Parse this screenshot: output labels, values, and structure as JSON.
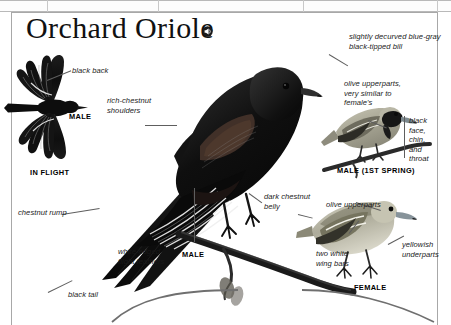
{
  "page": {
    "title": "Orchard Oriole",
    "audio_icon": "speaker-icon"
  },
  "callouts": [
    {
      "id": "black-back",
      "text": "black back"
    },
    {
      "id": "rich-chestnut",
      "text": "rich-chestnut\nshoulders"
    },
    {
      "id": "chestnut-rump",
      "text": "chestnut rump"
    },
    {
      "id": "white-edged",
      "text": "white-edged\nflight feathers"
    },
    {
      "id": "black-tail",
      "text": "black tail"
    },
    {
      "id": "dark-chestnut",
      "text": "dark chestnut\nbelly"
    },
    {
      "id": "decurved-bill",
      "text": "slightly decurved blue-gray\nblack-tipped bill"
    },
    {
      "id": "olive-upperparts-1",
      "text": "olive upperparts,\nvery similar to\nfemale's"
    },
    {
      "id": "black-face",
      "text": "black\nface,\nchin,\nand\nthroat"
    },
    {
      "id": "olive-upperparts-2",
      "text": "olive upperparts"
    },
    {
      "id": "two-white-bars",
      "text": "two white\nwing bars"
    },
    {
      "id": "yellowish-under",
      "text": "yellowish\nunderparts"
    }
  ],
  "plates": [
    {
      "id": "in-flight",
      "caption": "IN FLIGHT"
    },
    {
      "id": "flight-male",
      "caption": "MALE"
    },
    {
      "id": "perched-male",
      "caption": "MALE"
    },
    {
      "id": "male-first-spring",
      "caption": "MALE (1ST SPRING)"
    },
    {
      "id": "female",
      "caption": "FEMALE"
    }
  ],
  "colors": {
    "ink": "#1a1a1a",
    "rule": "#a8a8a8",
    "leader": "#5e5e5e",
    "bird_black": "#121212",
    "bird_chestnut": "#3a2a22",
    "bird_olive": "#9c9a86",
    "paper": "#ffffff"
  }
}
